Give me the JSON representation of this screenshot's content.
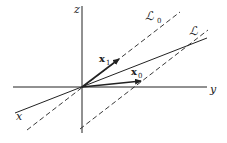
{
  "diagram": {
    "axes": {
      "x_label": "x",
      "y_label": "y",
      "z_label": "z"
    },
    "lines": [
      {
        "name": "L0",
        "label": "ℒ",
        "subscript": "0",
        "style": "dashed",
        "through_origin": true
      },
      {
        "name": "L",
        "label": "ℒ",
        "subscript": "",
        "style": "dashed",
        "through_origin": false
      }
    ],
    "vectors": [
      {
        "name": "x1",
        "label": "x",
        "subscript": "1",
        "style": "bold-arrow"
      },
      {
        "name": "x0",
        "label": "x",
        "subscript": "0",
        "style": "bold-arrow"
      }
    ]
  }
}
